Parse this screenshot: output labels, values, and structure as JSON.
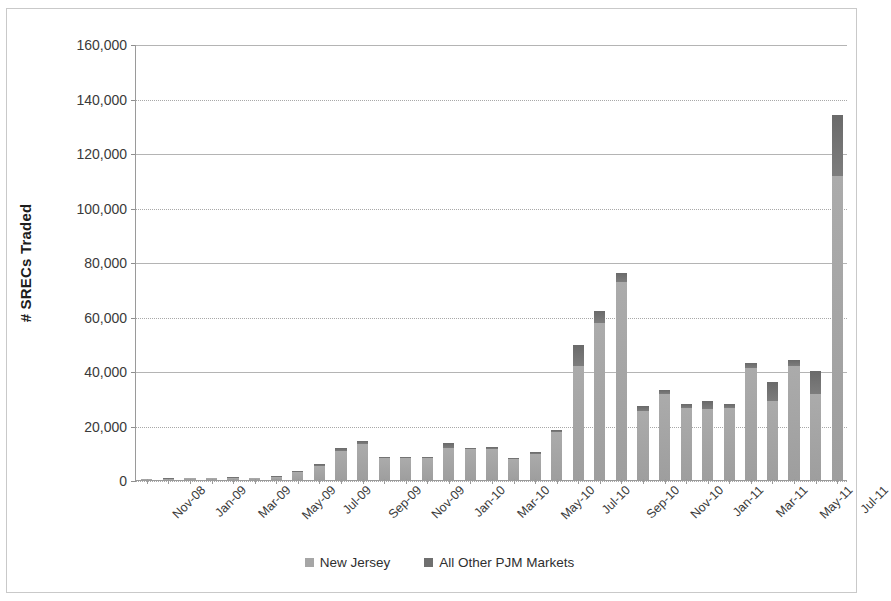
{
  "chart_data": {
    "type": "bar",
    "stacked": true,
    "title": "",
    "xlabel": "",
    "ylabel": "# SRECs Traded",
    "ylim": [
      0,
      160000
    ],
    "ytick_step": 20000,
    "ytick_labels": [
      "160,000",
      "140,000",
      "120,000",
      "100,000",
      "80,000",
      "60,000",
      "40,000",
      "20,000",
      "0"
    ],
    "ytick_values": [
      160000,
      140000,
      120000,
      100000,
      80000,
      60000,
      40000,
      20000,
      0
    ],
    "grid": true,
    "legend_position": "bottom",
    "categories": [
      "Nov-08",
      "Dec-08",
      "Jan-09",
      "Feb-09",
      "Mar-09",
      "Apr-09",
      "May-09",
      "Jun-09",
      "Jul-09",
      "Aug-09",
      "Sep-09",
      "Oct-09",
      "Nov-09",
      "Dec-09",
      "Jan-10",
      "Feb-10",
      "Mar-10",
      "Apr-10",
      "May-10",
      "Jun-10",
      "Jul-10",
      "Aug-10",
      "Sep-10",
      "Oct-10",
      "Nov-10",
      "Dec-10",
      "Jan-11",
      "Feb-11",
      "Mar-11",
      "Apr-11",
      "May-11",
      "Jun-11",
      "Jul-11"
    ],
    "xtick_labels_shown": [
      "Nov-08",
      "Jan-09",
      "Mar-09",
      "May-09",
      "Jul-09",
      "Sep-09",
      "Nov-09",
      "Jan-10",
      "Mar-10",
      "May-10",
      "Jul-10",
      "Sep-10",
      "Nov-10",
      "Jan-11",
      "Mar-11",
      "May-11",
      "Jul-11"
    ],
    "series": [
      {
        "name": "New Jersey",
        "color": "#a6a6a6",
        "values": [
          300,
          500,
          600,
          700,
          900,
          700,
          1100,
          2800,
          5200,
          10800,
          13200,
          7900,
          7900,
          8000,
          11800,
          11200,
          11400,
          7600,
          9600,
          17500,
          42000,
          57500,
          72500,
          25500,
          31500,
          26500,
          26000,
          26500,
          41000,
          29000,
          42000,
          31500,
          111500
        ]
      },
      {
        "name": "All Other PJM Markets",
        "color": "#6f6f6f",
        "values": [
          100,
          100,
          200,
          200,
          200,
          200,
          300,
          400,
          500,
          900,
          1000,
          400,
          400,
          400,
          1800,
          600,
          900,
          500,
          700,
          1000,
          7500,
          4500,
          3500,
          1500,
          1500,
          1500,
          3000,
          1500,
          2000,
          7000,
          2000,
          8500,
          22500
        ]
      }
    ],
    "totals": [
      400,
      600,
      800,
      900,
      1100,
      900,
      1400,
      3200,
      5700,
      11700,
      14200,
      8300,
      8300,
      8400,
      13600,
      11800,
      12300,
      8100,
      10300,
      18500,
      49500,
      62000,
      76000,
      27000,
      33000,
      28000,
      29000,
      28000,
      43000,
      36000,
      44000,
      40000,
      134000
    ]
  },
  "legend": {
    "items": [
      {
        "label": "New Jersey"
      },
      {
        "label": "All Other PJM Markets"
      }
    ]
  }
}
